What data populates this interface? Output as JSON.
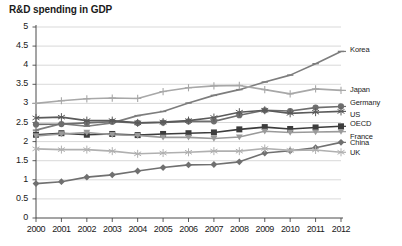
{
  "chart_data": {
    "type": "line",
    "title": "R&D spending in GDP",
    "xlabel": "",
    "ylabel": "",
    "xlim": [
      2000,
      2012
    ],
    "ylim": [
      0,
      5
    ],
    "ytick_step": 0.5,
    "grid": true,
    "legend_position": "right",
    "x": [
      2000,
      2001,
      2002,
      2003,
      2004,
      2005,
      2006,
      2007,
      2008,
      2009,
      2010,
      2011,
      2012
    ],
    "xticklabels": [
      "2000",
      "2001",
      "2002",
      "2003",
      "2004",
      "2005",
      "2006",
      "2007",
      "2008",
      "2009",
      "2010",
      "2011",
      "2012"
    ],
    "yticklabels": [
      "0",
      "0.5",
      "1",
      "1.5",
      "2",
      "2.5",
      "3",
      "3.5",
      "4",
      "4.5",
      "5"
    ],
    "series": [
      {
        "name": "Korea",
        "color": "#7d7d7d",
        "marker": "dash",
        "values": [
          2.3,
          2.47,
          2.4,
          2.49,
          2.68,
          2.79,
          3.01,
          3.21,
          3.36,
          3.56,
          3.74,
          4.04,
          4.36
        ]
      },
      {
        "name": "Japan",
        "color": "#a8a8a8",
        "marker": "plus",
        "values": [
          3.0,
          3.07,
          3.12,
          3.14,
          3.13,
          3.31,
          3.41,
          3.46,
          3.47,
          3.36,
          3.25,
          3.38,
          3.34
        ]
      },
      {
        "name": "Germany",
        "color": "#6e6e6e",
        "marker": "circle",
        "values": [
          2.45,
          2.46,
          2.49,
          2.52,
          2.49,
          2.5,
          2.53,
          2.53,
          2.69,
          2.82,
          2.8,
          2.89,
          2.92
        ]
      },
      {
        "name": "US",
        "color": "#5a5a5a",
        "marker": "star",
        "values": [
          2.62,
          2.64,
          2.55,
          2.55,
          2.49,
          2.51,
          2.55,
          2.63,
          2.77,
          2.82,
          2.74,
          2.77,
          2.79
        ]
      },
      {
        "name": "OECD",
        "color": "#3d3d3d",
        "marker": "square",
        "values": [
          2.18,
          2.22,
          2.18,
          2.2,
          2.17,
          2.2,
          2.22,
          2.24,
          2.32,
          2.38,
          2.33,
          2.37,
          2.4
        ]
      },
      {
        "name": "France",
        "color": "#9a9a9a",
        "marker": "triangle",
        "values": [
          2.15,
          2.2,
          2.24,
          2.18,
          2.16,
          2.11,
          2.11,
          2.08,
          2.12,
          2.27,
          2.24,
          2.25,
          2.26
        ]
      },
      {
        "name": "China",
        "color": "#707070",
        "marker": "diamond",
        "values": [
          0.9,
          0.95,
          1.07,
          1.13,
          1.23,
          1.32,
          1.39,
          1.4,
          1.47,
          1.7,
          1.76,
          1.84,
          1.98
        ]
      },
      {
        "name": "UK",
        "color": "#b0b0b0",
        "marker": "asterisk",
        "values": [
          1.81,
          1.79,
          1.79,
          1.75,
          1.68,
          1.7,
          1.72,
          1.75,
          1.75,
          1.82,
          1.77,
          1.78,
          1.72
        ]
      }
    ]
  }
}
